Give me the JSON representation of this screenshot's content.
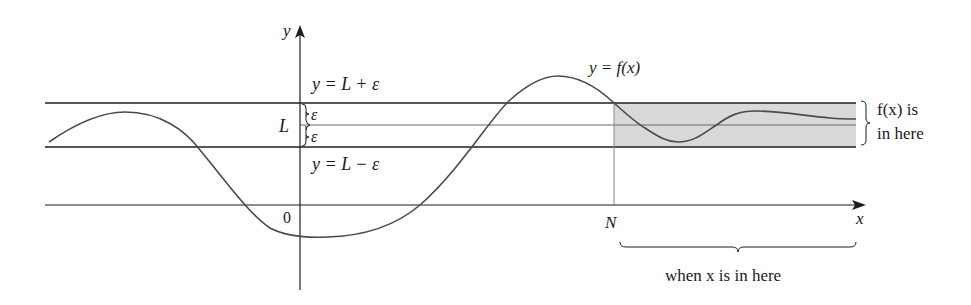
{
  "figure": {
    "colors": {
      "line": "#1e1e1e",
      "curve": "#4a4a4a",
      "band_fill": "#d9d9d9",
      "guide": "#8a8a8a",
      "background": "#ffffff"
    }
  },
  "axes": {
    "y_label": "y",
    "x_label": "x",
    "origin_label": "0",
    "n_label": "N"
  },
  "lines": {
    "upper_label": "y = L + ε",
    "lower_label": "y = L − ε",
    "middle_label": "L",
    "epsilon_upper": "ε",
    "epsilon_lower": "ε"
  },
  "curve": {
    "label": "y = f(x)"
  },
  "annotations": {
    "fx_line1": "f(x) is",
    "fx_line2": "in here",
    "x_range": "when x is in here"
  }
}
